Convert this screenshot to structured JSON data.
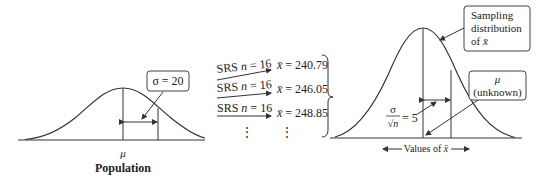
{
  "population": {
    "sigma_label": "σ = 20",
    "mu_label": "μ",
    "caption": "Population"
  },
  "samples": [
    {
      "label": "SRS n = 16",
      "srs": "SRS ",
      "n": "n",
      "eq": " = 16",
      "xbar_label": "x̄ = 240.79",
      "xbar": "x̄",
      "value": " = 240.79"
    },
    {
      "label": "SRS n = 16",
      "srs": "SRS ",
      "n": "n",
      "eq": " = 16",
      "xbar_label": "x̄ = 246.05",
      "xbar": "x̄",
      "value": " = 246.05"
    },
    {
      "label": "SRS n = 16",
      "srs": "SRS ",
      "n": "n",
      "eq": " = 16",
      "xbar_label": "x̄ = 248.85",
      "xbar": "x̄",
      "value": " = 248.85"
    }
  ],
  "ellipsis": "⋮",
  "sampling": {
    "box_line1": "Sampling",
    "box_line2": "distribution",
    "box_line3": "of x̄",
    "mu_box_line1": "μ",
    "mu_box_line2": "(unknown)",
    "se_numer": "σ",
    "se_denom": "√n",
    "se_value": "= 5",
    "axis_label": "Values of x̄"
  },
  "colors": {
    "line": "#333333",
    "box_border": "#444444"
  }
}
